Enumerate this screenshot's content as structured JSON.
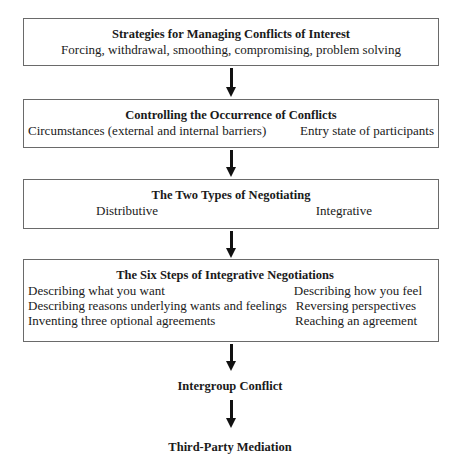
{
  "diagram": {
    "boxes": [
      {
        "title": "Strategies for Managing Conflicts of Interest",
        "lines": [
          "Forcing, withdrawal, smoothing, compromising, problem solving"
        ]
      },
      {
        "title": "Controlling the Occurrence of Conflicts",
        "left": [
          "Circumstances (external and internal barriers)"
        ],
        "right": [
          "Entry state of participants"
        ]
      },
      {
        "title": "The Two Types of Negotiating",
        "left": [
          "Distributive"
        ],
        "right": [
          "Integrative"
        ]
      },
      {
        "title": "The Six Steps of Integrative Negotiations",
        "left": [
          "Describing what you want",
          "Describing reasons underlying wants and feelings",
          "Inventing three optional agreements"
        ],
        "right": [
          "Describing how you feel",
          "Reversing perspectives",
          "Reaching an agreement"
        ]
      }
    ],
    "nodes": [
      {
        "label": "Intergroup Conflict"
      },
      {
        "label": "Third-Party Mediation"
      }
    ],
    "arrow_color": "#111111",
    "border_color": "#6a6a6a"
  }
}
